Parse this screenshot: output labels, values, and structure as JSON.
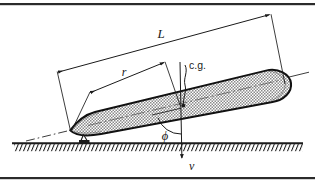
{
  "figure": {
    "background_color": "#ffffff",
    "line_color": "#1a1a1a",
    "body_fill_color": "#b9b9b9",
    "border": {
      "color": "#2b2b2b",
      "top_y": 4,
      "bottom_y": 178
    }
  },
  "labels": {
    "length": "L",
    "radius": "r",
    "center_of_gravity": "c.g.",
    "angle": "ϕ",
    "velocity": "v"
  },
  "geometry": {
    "body": {
      "nose_x": 70,
      "nose_y": 130,
      "tail_x": 283,
      "tail_y": 78,
      "half_width": 16,
      "tilt_degrees": -14
    },
    "dimension_L": {
      "from_label": "nose",
      "to_label": "tail",
      "offset": "upper-left"
    },
    "dimension_r": {
      "from_label": "nose",
      "to_label": "c.g.",
      "offset": "upper-left"
    },
    "ground": {
      "y": 143,
      "x_start": 12,
      "x_end": 303,
      "hatch": true
    },
    "velocity_vector": {
      "direction": "down",
      "tip_x": 182,
      "tip_y": 160
    }
  },
  "annotations": {
    "centerline_style": "dash-dot",
    "axis_extends_beyond_body": true,
    "angle_arc_between": "body-axis and velocity-vector"
  }
}
